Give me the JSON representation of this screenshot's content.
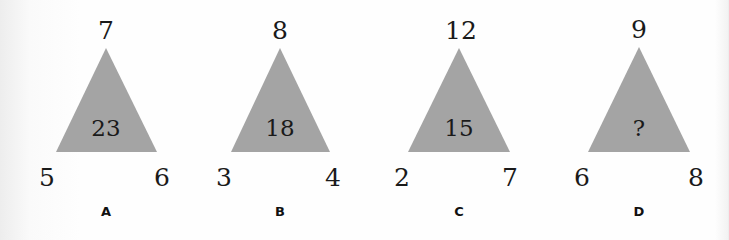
{
  "colors": {
    "triangle_fill": "#a4a4a4",
    "text": "#1a1a1a"
  },
  "puzzles": [
    {
      "label": "A",
      "top": "7",
      "left": "5",
      "right": "6",
      "center": "23"
    },
    {
      "label": "B",
      "top": "8",
      "left": "3",
      "right": "4",
      "center": "18"
    },
    {
      "label": "C",
      "top": "12",
      "left": "2",
      "right": "7",
      "center": "15"
    },
    {
      "label": "D",
      "top": "9",
      "left": "6",
      "right": "8",
      "center": "?"
    }
  ]
}
